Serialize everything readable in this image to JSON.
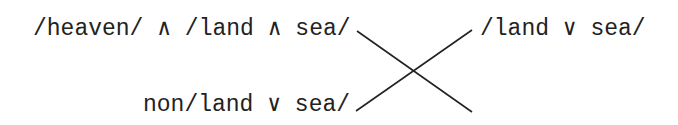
{
  "diagram": {
    "labels": {
      "top_left": "/heaven/ ∧ /land ∧ sea/",
      "top_right": "/land ∨ sea/",
      "bottom_left": "non/land ∨ sea/"
    },
    "edges": [
      {
        "from": "top_left",
        "to": "bottom_right_end",
        "x1": 357,
        "y1": 31,
        "x2": 472,
        "y2": 112
      },
      {
        "from": "bottom_left",
        "to": "top_right",
        "x1": 356,
        "y1": 111,
        "x2": 472,
        "y2": 30
      }
    ],
    "line_color": "#222222"
  }
}
